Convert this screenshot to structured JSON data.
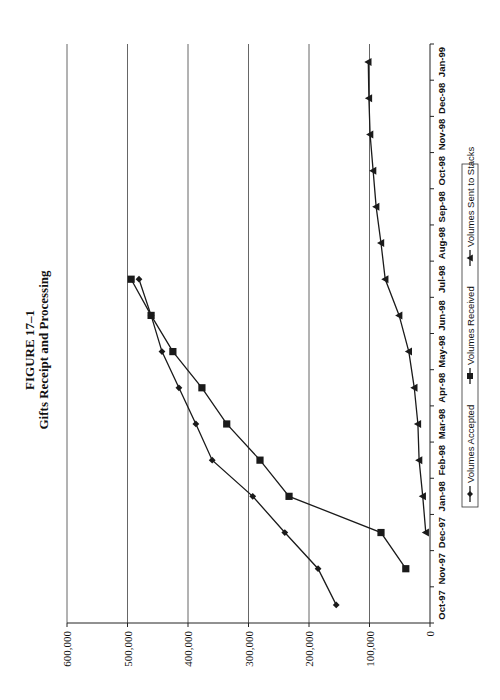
{
  "figure": {
    "number": "FIGURE 17–1",
    "title": "Gifts Receipt and Processing",
    "orientation": "rotated-90-ccw"
  },
  "chart_data": {
    "type": "line",
    "title": "FIGURE 17–1 Gifts Receipt and Processing",
    "xlabel": "",
    "ylabel": "",
    "categories": [
      "Oct-97",
      "Nov-97",
      "Dec-97",
      "Jan-98",
      "Feb-98",
      "Mar-98",
      "Apr-98",
      "May-98",
      "Jun-98",
      "Jul-98",
      "Aug-98",
      "Sep-98",
      "Oct-98",
      "Nov-98",
      "Dec-98",
      "Jan-99"
    ],
    "ylim": [
      0,
      600000
    ],
    "yticks": [
      0,
      100000,
      200000,
      300000,
      400000,
      500000,
      600000
    ],
    "ytick_labels": [
      "0",
      "100,000",
      "200,000",
      "300,000",
      "400,000",
      "500,000",
      "600,000"
    ],
    "grid": {
      "y_major": true,
      "x_major": false
    },
    "legend_position": "bottom",
    "series": [
      {
        "name": "Volumes Accepted",
        "marker": "diamond",
        "values": [
          155000,
          185000,
          240000,
          293000,
          360000,
          387000,
          415000,
          443000,
          461000,
          481000,
          null,
          null,
          null,
          null,
          null,
          null
        ]
      },
      {
        "name": "Volumes Received",
        "marker": "square",
        "values": [
          null,
          40000,
          81000,
          233000,
          281000,
          336000,
          377000,
          425000,
          461000,
          494000,
          null,
          null,
          null,
          null,
          null,
          null
        ]
      },
      {
        "name": "Volumes Sent to Stacks",
        "marker": "triangle",
        "values": [
          null,
          null,
          7000,
          12000,
          18000,
          20000,
          26000,
          35000,
          51000,
          74000,
          81000,
          89000,
          94000,
          99000,
          101000,
          102000
        ]
      }
    ]
  },
  "legend": {
    "items": [
      {
        "label": "Volumes Accepted",
        "marker": "diamond"
      },
      {
        "label": "Volumes Received",
        "marker": "square"
      },
      {
        "label": "Volumes Sent to Stacks",
        "marker": "triangle"
      }
    ]
  },
  "colors": {
    "line": "#1a1a1a",
    "grid": "#555555",
    "background": "#ffffff",
    "text": "#111111"
  }
}
